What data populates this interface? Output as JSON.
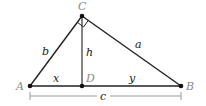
{
  "diagram": {
    "points": {
      "A": {
        "label": "A",
        "x": 30,
        "y": 86
      },
      "B": {
        "label": "B",
        "x": 181,
        "y": 86
      },
      "C": {
        "label": "C",
        "x": 82,
        "y": 16
      },
      "D": {
        "label": "D",
        "x": 82,
        "y": 86
      }
    },
    "segments": {
      "a": {
        "label": "a",
        "from": "C",
        "to": "B"
      },
      "b": {
        "label": "b",
        "from": "A",
        "to": "C"
      },
      "h": {
        "label": "h",
        "from": "C",
        "to": "D"
      },
      "x": {
        "label": "x",
        "from": "A",
        "to": "D"
      },
      "y": {
        "label": "y",
        "from": "D",
        "to": "B"
      },
      "c": {
        "label": "c",
        "from": "A",
        "to": "B",
        "style": "dimension"
      }
    },
    "right_angle_at": "C",
    "colors": {
      "line": "#222222",
      "point_label": "#8a8a8a",
      "dimension_line": "#9a9a9a"
    }
  }
}
